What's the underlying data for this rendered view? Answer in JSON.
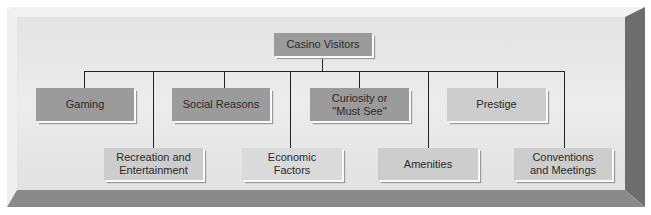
{
  "diagram": {
    "type": "hierarchy",
    "root": {
      "label": "Casino Visitors"
    },
    "children_top_row": [
      {
        "label": "Gaming"
      },
      {
        "label": "Social Reasons"
      },
      {
        "label": "Curiosity or \"Must See\""
      },
      {
        "label": "Prestige"
      }
    ],
    "children_bottom_row": [
      {
        "label": "Recreation and Entertainment"
      },
      {
        "label": "Economic Factors"
      },
      {
        "label": "Amenities"
      },
      {
        "label": "Conventions and Meetings"
      }
    ]
  },
  "colors": {
    "panel": "#e6e6e6",
    "box_dark": "#9b9b9b",
    "box_light": "#cdcdcd",
    "bevel_right": "#6e6e6e",
    "bevel_bottom": "#8a8a8a",
    "connector": "#222222"
  }
}
